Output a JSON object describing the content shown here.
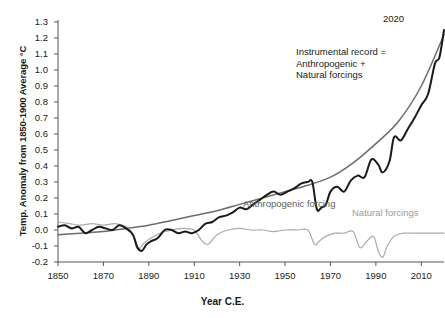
{
  "chart_data": {
    "type": "line",
    "title": "",
    "xlabel": "Year C.E.",
    "ylabel": "Temp. Anomaly from 1850-1900 Average °C",
    "xlim": [
      1850,
      2020
    ],
    "ylim": [
      -0.2,
      1.3
    ],
    "grid": false,
    "legend_position": "inline-annotations",
    "xticks": [
      1850,
      1870,
      1890,
      1910,
      1930,
      1950,
      1970,
      1990,
      2010
    ],
    "yticks": [
      -0.2,
      -0.1,
      0.0,
      0.1,
      0.2,
      0.3,
      0.4,
      0.5,
      0.6,
      0.7,
      0.8,
      0.9,
      1.0,
      1.1,
      1.2,
      1.3
    ],
    "annotations": [
      {
        "name": "end-year",
        "text": "2020"
      },
      {
        "name": "instrumental-note",
        "lines": [
          "Instrumental record =",
          "Anthropogenic +",
          "Natural forcings"
        ]
      },
      {
        "name": "anthropogenic-label",
        "text": "Anthropogenic forcing"
      },
      {
        "name": "natural-label",
        "text": "Natural forcings"
      }
    ],
    "colors": {
      "instrumental": "#1a1a1a",
      "anthropogenic": "#6b6b6b",
      "natural": "#aaaaaa",
      "axis": "#555555",
      "background": "#ffffff"
    },
    "series": [
      {
        "name": "Instrumental record",
        "color": "#1a1a1a",
        "x": [
          1850,
          1853,
          1856,
          1859,
          1862,
          1865,
          1868,
          1871,
          1874,
          1877,
          1880,
          1883,
          1885,
          1887,
          1889,
          1891,
          1894,
          1897,
          1900,
          1903,
          1906,
          1909,
          1912,
          1915,
          1918,
          1921,
          1924,
          1927,
          1930,
          1933,
          1936,
          1939,
          1942,
          1945,
          1948,
          1951,
          1954,
          1957,
          1960,
          1962,
          1964,
          1966,
          1968,
          1970,
          1973,
          1976,
          1979,
          1982,
          1985,
          1988,
          1991,
          1993,
          1996,
          1998,
          2001,
          2004,
          2007,
          2010,
          2013,
          2016,
          2018,
          2020
        ],
        "y": [
          0.02,
          0.03,
          0.01,
          0.02,
          -0.02,
          0.0,
          0.02,
          0.01,
          0.0,
          0.03,
          0.01,
          -0.03,
          -0.11,
          -0.13,
          -0.09,
          -0.07,
          -0.05,
          0.0,
          0.0,
          -0.02,
          -0.01,
          -0.02,
          0.0,
          0.04,
          0.05,
          0.08,
          0.09,
          0.11,
          0.14,
          0.13,
          0.16,
          0.19,
          0.22,
          0.24,
          0.22,
          0.24,
          0.26,
          0.29,
          0.3,
          0.3,
          0.13,
          0.14,
          0.16,
          0.24,
          0.27,
          0.24,
          0.31,
          0.34,
          0.33,
          0.44,
          0.41,
          0.36,
          0.43,
          0.58,
          0.56,
          0.63,
          0.7,
          0.78,
          0.85,
          1.04,
          1.08,
          1.25
        ]
      },
      {
        "name": "Anthropogenic forcing",
        "color": "#6b6b6b",
        "x": [
          1850,
          1860,
          1870,
          1880,
          1890,
          1900,
          1910,
          1920,
          1930,
          1940,
          1950,
          1960,
          1970,
          1980,
          1990,
          2000,
          2010,
          2020
        ],
        "y": [
          -0.03,
          -0.02,
          -0.01,
          0.01,
          0.03,
          0.06,
          0.09,
          0.12,
          0.16,
          0.2,
          0.24,
          0.28,
          0.33,
          0.42,
          0.54,
          0.68,
          0.9,
          1.22
        ]
      },
      {
        "name": "Natural forcings",
        "color": "#aaaaaa",
        "x": [
          1850,
          1855,
          1860,
          1865,
          1870,
          1875,
          1880,
          1883,
          1885,
          1888,
          1891,
          1895,
          1900,
          1905,
          1910,
          1913,
          1916,
          1920,
          1925,
          1930,
          1935,
          1940,
          1945,
          1950,
          1955,
          1960,
          1963,
          1965,
          1968,
          1972,
          1976,
          1980,
          1983,
          1986,
          1989,
          1991,
          1993,
          1995,
          1998,
          2002,
          2006,
          2010,
          2014,
          2018,
          2020
        ],
        "y": [
          0.05,
          0.04,
          0.03,
          0.04,
          0.03,
          0.04,
          0.02,
          -0.03,
          -0.12,
          -0.08,
          -0.05,
          -0.02,
          0.0,
          0.01,
          0.0,
          -0.06,
          -0.09,
          -0.03,
          0.0,
          0.01,
          0.0,
          0.0,
          -0.01,
          0.0,
          0.0,
          0.0,
          -0.09,
          -0.07,
          -0.04,
          -0.02,
          -0.02,
          -0.01,
          -0.11,
          -0.07,
          -0.04,
          -0.13,
          -0.17,
          -0.1,
          -0.04,
          -0.02,
          -0.02,
          -0.02,
          -0.02,
          -0.02,
          -0.02
        ]
      }
    ]
  }
}
